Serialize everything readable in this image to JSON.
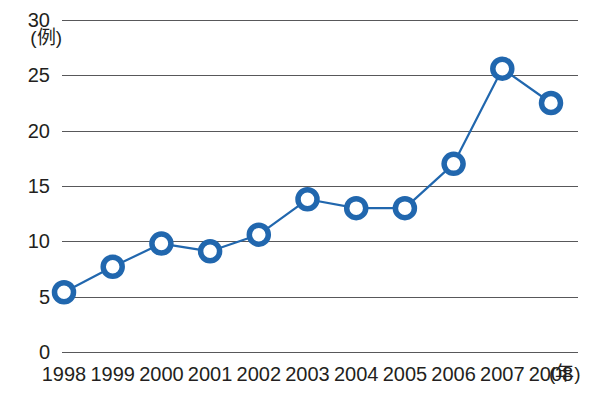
{
  "chart_data": {
    "type": "line",
    "title": "",
    "subtitle": "",
    "xlabel": "(年)",
    "ylabel": "(例)",
    "categories": [
      "1998",
      "1999",
      "2000",
      "2001",
      "2002",
      "2003",
      "2004",
      "2005",
      "2006",
      "2007",
      "2008"
    ],
    "x": [
      1998,
      1999,
      2000,
      2001,
      2002,
      2003,
      2004,
      2005,
      2006,
      2007,
      2008
    ],
    "values": [
      5.4,
      7.7,
      9.8,
      9.1,
      10.6,
      13.8,
      13.0,
      13.0,
      17.0,
      25.6,
      22.5
    ],
    "series": [
      {
        "name": "",
        "values": [
          5.4,
          7.7,
          9.8,
          9.1,
          10.6,
          13.8,
          13.0,
          13.0,
          17.0,
          25.6,
          22.5
        ]
      }
    ],
    "ylim": [
      0,
      30
    ],
    "yticks": [
      0,
      5,
      10,
      15,
      20,
      25,
      30
    ],
    "ytick_labels": [
      "0",
      "5",
      "10",
      "15",
      "20",
      "25",
      "30"
    ],
    "xtick_labels": [
      "1998",
      "1999",
      "2000",
      "2001",
      "2002",
      "2003",
      "2004",
      "2005",
      "2006",
      "2007",
      "2008"
    ],
    "grid": true,
    "grid_axis": "y",
    "legend": false,
    "legend_position": "none",
    "marker": "circle-open",
    "annotations": []
  },
  "style": {
    "series_color": "#2167ae",
    "marker_fill": "#ffffff",
    "grid_color": "#58585a",
    "text_color": "#231f20",
    "background": "#ffffff"
  },
  "axis": {
    "y_unit": "(例)",
    "x_unit": "(年)"
  }
}
